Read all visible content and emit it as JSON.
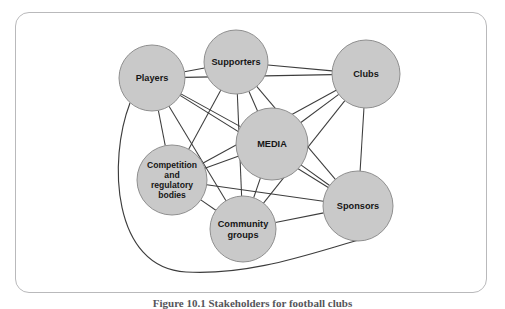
{
  "figure": {
    "caption": "Figure 10.1  Stakeholders for football clubs",
    "frame_border_color": "#b9b9bb",
    "background_color": "#ffffff"
  },
  "chart_data": {
    "type": "diagram",
    "diagram_kind": "network-graph",
    "title": "Stakeholders for football clubs",
    "node_fill_color": "#c9c9c9",
    "node_stroke_color": "#8f8f8f",
    "edge_color": "#3d3d3d",
    "nodes": [
      {
        "id": "players",
        "label": "Players",
        "lines": [
          "Players"
        ],
        "cx": 152,
        "cy": 78,
        "r": 33
      },
      {
        "id": "supporters",
        "label": "Supporters",
        "lines": [
          "Supporters"
        ],
        "cx": 236,
        "cy": 62,
        "r": 32
      },
      {
        "id": "clubs",
        "label": "Clubs",
        "lines": [
          "Clubs"
        ],
        "cx": 366,
        "cy": 74,
        "r": 34
      },
      {
        "id": "media",
        "label": "MEDIA",
        "lines": [
          "MEDIA"
        ],
        "cx": 272,
        "cy": 144,
        "r": 36
      },
      {
        "id": "competition",
        "label": "Competition and regulatory bodies",
        "lines": [
          "Competition",
          "and",
          "regulatory",
          "bodies"
        ],
        "cx": 172,
        "cy": 180,
        "r": 35
      },
      {
        "id": "community",
        "label": "Community groups",
        "lines": [
          "Community",
          "groups"
        ],
        "cx": 243,
        "cy": 229,
        "r": 33
      },
      {
        "id": "sponsors",
        "label": "Sponsors",
        "lines": [
          "Sponsors"
        ],
        "cx": 358,
        "cy": 206,
        "r": 35
      }
    ],
    "edges": [
      {
        "from": "players",
        "to": "supporters"
      },
      {
        "from": "supporters",
        "to": "clubs"
      },
      {
        "from": "players",
        "to": "clubs"
      },
      {
        "from": "players",
        "to": "media"
      },
      {
        "from": "players",
        "to": "competition"
      },
      {
        "from": "players",
        "to": "community"
      },
      {
        "from": "players",
        "to": "sponsors"
      },
      {
        "from": "supporters",
        "to": "media"
      },
      {
        "from": "supporters",
        "to": "competition"
      },
      {
        "from": "supporters",
        "to": "community"
      },
      {
        "from": "supporters",
        "to": "sponsors"
      },
      {
        "from": "clubs",
        "to": "media"
      },
      {
        "from": "clubs",
        "to": "competition"
      },
      {
        "from": "clubs",
        "to": "community"
      },
      {
        "from": "clubs",
        "to": "sponsors"
      },
      {
        "from": "media",
        "to": "competition"
      },
      {
        "from": "media",
        "to": "community"
      },
      {
        "from": "media",
        "to": "sponsors"
      },
      {
        "from": "competition",
        "to": "community"
      },
      {
        "from": "competition",
        "to": "sponsors"
      },
      {
        "from": "community",
        "to": "sponsors"
      },
      {
        "from": "players",
        "to": "sponsors",
        "style": "curved-outer"
      }
    ]
  }
}
